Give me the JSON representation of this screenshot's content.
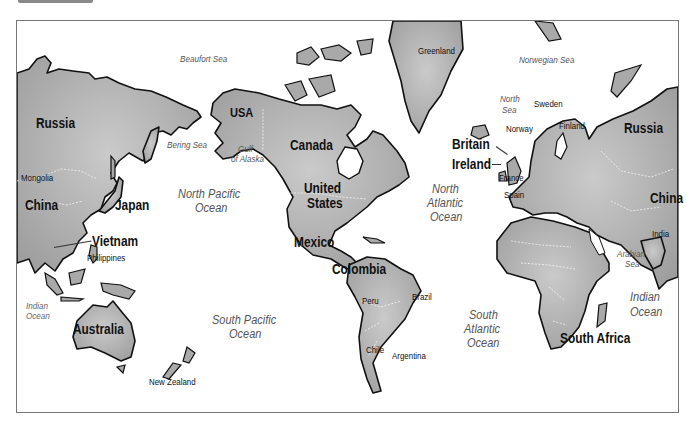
{
  "map": {
    "title": "World map (Pacific-centered)",
    "countries": {
      "russia_west": "Russia",
      "russia_east": "Russia",
      "mongolia": "Mongolia",
      "china_west": "China",
      "china_east": "China",
      "japan": "Japan",
      "vietnam": "Vietnam",
      "philippines": "Philippines",
      "australia": "Australia",
      "new_zealand": "New Zealand",
      "usa_alaska": "USA",
      "canada": "Canada",
      "united_states_1": "United",
      "united_states_2": "States",
      "mexico": "Mexico",
      "colombia": "Colombia",
      "peru": "Peru",
      "brazil": "Brazil",
      "chile": "Chile",
      "argentina": "Argentina",
      "greenland": "Greenland",
      "britain": "Britain",
      "ireland": "Ireland",
      "norway": "Norway",
      "sweden": "Sweden",
      "finland": "Finland",
      "france": "France",
      "spain": "Spain",
      "india": "India",
      "south_africa": "South Africa"
    },
    "seas": {
      "beaufort": "Beaufort Sea",
      "bering": "Bering Sea",
      "gulf_alaska_1": "Gulf",
      "gulf_alaska_2": "of Alaska",
      "norwegian": "Norwegian Sea",
      "north_sea_1": "North",
      "north_sea_2": "Sea",
      "arabian_1": "Arabian",
      "arabian_2": "Sea"
    },
    "oceans": {
      "north_pacific_1": "North Pacific",
      "north_pacific_2": "Ocean",
      "south_pacific_1": "South Pacific",
      "south_pacific_2": "Ocean",
      "north_atlantic_1": "North",
      "north_atlantic_2": "Atlantic",
      "north_atlantic_3": "Ocean",
      "south_atlantic_1": "South",
      "south_atlantic_2": "Atlantic",
      "south_atlantic_3": "Ocean",
      "indian_west_1": "Indian",
      "indian_west_2": "Ocean",
      "indian_east_1": "Indian",
      "indian_east_2": "Ocean"
    },
    "colors": {
      "land": "#a8a8a8",
      "land_light": "#c8c8c8",
      "coast": "#111111",
      "water": "#ffffff",
      "ocean_label": "#555555"
    }
  }
}
